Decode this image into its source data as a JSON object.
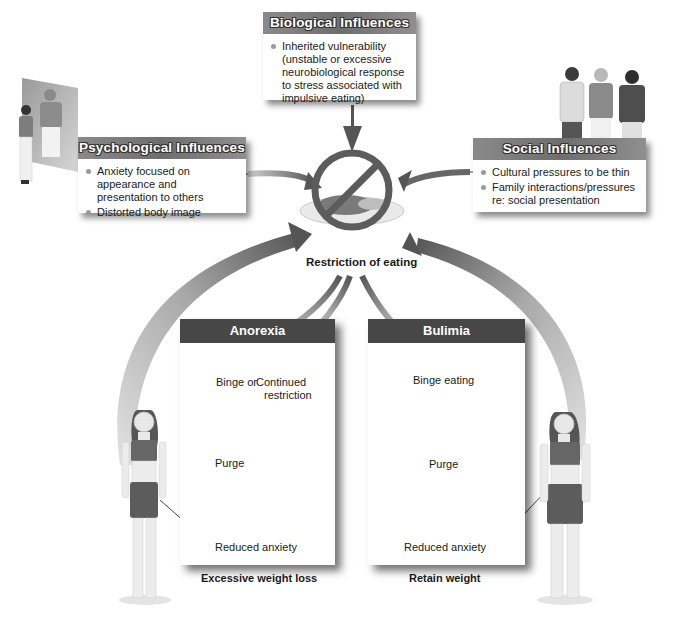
{
  "influences": {
    "biological": {
      "title": "Biological Influences",
      "bullets": [
        "Inherited vulnerability (unstable or excessive neurobiological response to stress associated with impulsive eating)"
      ]
    },
    "psychological": {
      "title": "Psychological Influences",
      "bullets": [
        "Anxiety focused on appearance and presentation to others",
        "Distorted body image"
      ]
    },
    "social": {
      "title": "Social Influences",
      "bullets": [
        "Cultural pressures to be thin",
        "Family interactions/pressures re: social presentation"
      ]
    }
  },
  "center": {
    "label": "Restriction of eating",
    "icon": "no-food-plate-icon"
  },
  "anorexia": {
    "title": "Anorexia",
    "branch_left": "Binge or",
    "branch_right_line1": "Continued",
    "branch_right_line2": "restriction",
    "purge": "Purge",
    "outcome": "Reduced anxiety",
    "result": "Excessive weight loss"
  },
  "bulimia": {
    "title": "Bulimia",
    "step1": "Binge eating",
    "purge": "Purge",
    "outcome": "Reduced anxiety",
    "result": "Retain weight"
  },
  "colors": {
    "header_gray": "#7a7a7a",
    "panel_header": "#474747",
    "arrow_dark": "#5a5a5a",
    "arrow_light": "#cfcfcf",
    "bullet": "#9a9a9a"
  }
}
